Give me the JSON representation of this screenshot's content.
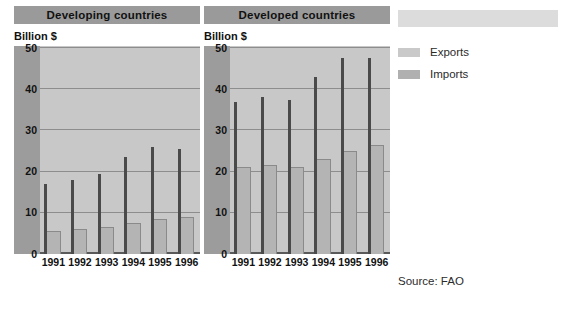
{
  "panels": [
    {
      "title": "Developing countries",
      "unit": "Billion $"
    },
    {
      "title": "Developed countries",
      "unit": "Billion $"
    }
  ],
  "legend": {
    "banner_text": "",
    "items": [
      {
        "label": "Exports",
        "color": "#c9c9c9"
      },
      {
        "label": "Imports",
        "color": "#b0b0b0"
      }
    ]
  },
  "source": "Source: FAO",
  "chart_data": [
    {
      "type": "bar",
      "title": "Developing countries",
      "xlabel": "",
      "ylabel": "Billion $",
      "ylim": [
        0,
        50
      ],
      "yticks": [
        0,
        10,
        20,
        30,
        40,
        50
      ],
      "grid": true,
      "legend_position": "right",
      "categories": [
        "1991",
        "1992",
        "1993",
        "1994",
        "1995",
        "1996"
      ],
      "series": [
        {
          "name": "Exports",
          "values": [
            5.5,
            6.0,
            6.5,
            7.5,
            8.5,
            9.0
          ]
        },
        {
          "name": "Imports",
          "values": [
            17.0,
            18.0,
            19.5,
            23.5,
            26.0,
            25.5
          ]
        }
      ]
    },
    {
      "type": "bar",
      "title": "Developed countries",
      "xlabel": "",
      "ylabel": "Billion $",
      "ylim": [
        0,
        50
      ],
      "yticks": [
        0,
        10,
        20,
        30,
        40,
        50
      ],
      "grid": true,
      "legend_position": "right",
      "categories": [
        "1991",
        "1992",
        "1993",
        "1994",
        "1995",
        "1996"
      ],
      "series": [
        {
          "name": "Exports",
          "values": [
            21.0,
            21.5,
            21.0,
            23.0,
            25.0,
            26.5
          ]
        },
        {
          "name": "Imports",
          "values": [
            37.0,
            38.0,
            37.5,
            43.0,
            47.5,
            47.5
          ]
        }
      ]
    }
  ]
}
